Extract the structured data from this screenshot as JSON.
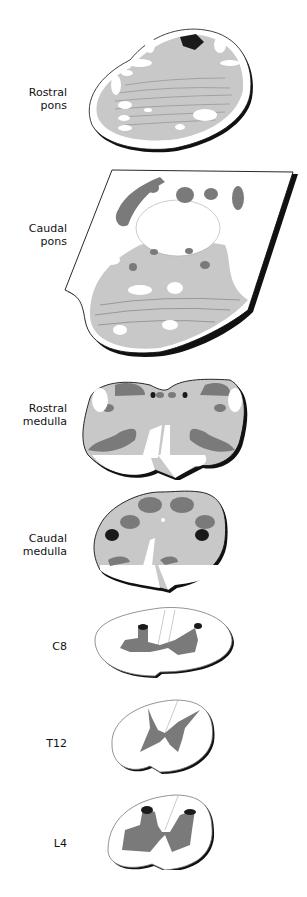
{
  "figure": {
    "type": "anatomical cross-sections",
    "colors": {
      "gray_matter_light": "#c8c8c8",
      "nuclei_dark": "#7a7a7a",
      "black_regions": "#1a1a1a",
      "white_matter": "#ffffff",
      "outline": "#111111"
    },
    "sections": [
      {
        "label_lines": [
          "Rostral",
          "pons"
        ]
      },
      {
        "label_lines": [
          "Caudal",
          "pons"
        ]
      },
      {
        "label_lines": [
          "Rostral",
          "medulla"
        ]
      },
      {
        "label_lines": [
          "Caudal",
          "medulla"
        ]
      },
      {
        "label_lines": [
          "C8"
        ]
      },
      {
        "label_lines": [
          "T12"
        ]
      },
      {
        "label_lines": [
          "L4"
        ]
      }
    ]
  }
}
